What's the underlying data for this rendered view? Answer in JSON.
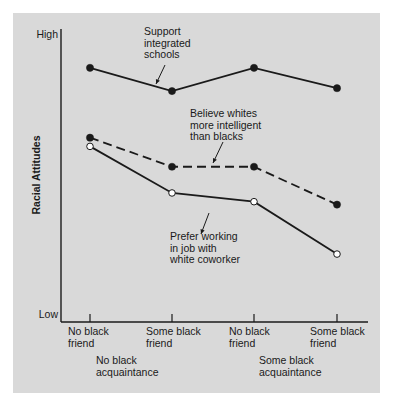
{
  "chart_data": {
    "type": "line",
    "title": "",
    "xlabel": "",
    "ylabel": "Racial Attitudes",
    "y_tick_labels": [
      "High",
      "Low"
    ],
    "ylim": [
      0,
      100
    ],
    "grid": false,
    "legend": "inline annotations with arrows",
    "categories": [
      "No black friend / No black acquaintance",
      "Some black friend / No black acquaintance",
      "No black friend / Some black acquaintance",
      "Some black friend / Some black acquaintance"
    ],
    "x_tick_labels": [
      [
        "No black",
        "friend"
      ],
      [
        "Some black",
        "friend"
      ],
      [
        "No black",
        "friend"
      ],
      [
        "Some black",
        "friend"
      ]
    ],
    "x_group_labels": [
      [
        "No black",
        "acquaintance"
      ],
      [
        "Some black",
        "acquaintance"
      ]
    ],
    "series": [
      {
        "name": "Support integrated schools",
        "annotation": [
          "Support",
          "integrated",
          "schools"
        ],
        "style": "solid",
        "marker": "filled-circle",
        "values": [
          87,
          79,
          87,
          80
        ]
      },
      {
        "name": "Believe whites more intelligent than blacks",
        "annotation": [
          "Believe whites",
          "more intelligent",
          "than blacks"
        ],
        "style": "dashed",
        "marker": "filled-circle",
        "values": [
          63,
          53,
          53,
          40
        ]
      },
      {
        "name": "Prefer working in job with white coworker",
        "annotation": [
          "Prefer working",
          "in job with",
          "white coworker"
        ],
        "style": "solid",
        "marker": "open-circle",
        "values": [
          60,
          44,
          41,
          23
        ]
      }
    ]
  },
  "colors": {
    "panel": "#d9d9d9",
    "ink": "#1a1a1a",
    "page": "#ffffff"
  }
}
